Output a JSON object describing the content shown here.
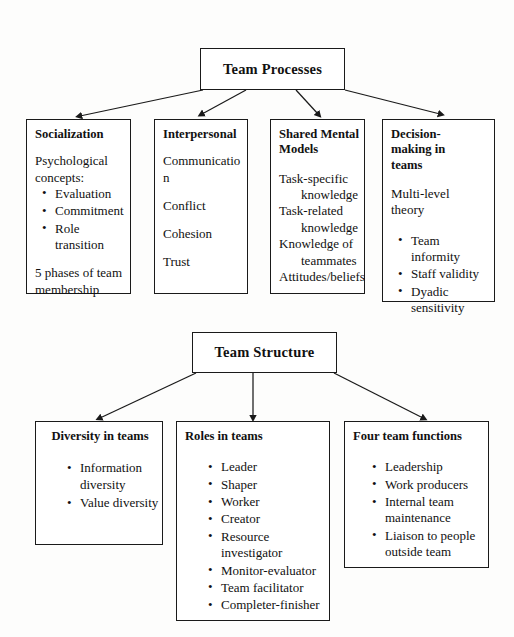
{
  "diagram": {
    "type": "hierarchy-flowchart",
    "sections": [
      {
        "id": "team-processes",
        "root": "Team Processes",
        "children": [
          {
            "id": "socialization",
            "title": "Socialization",
            "lead": "Psychological concepts:",
            "bullets": [
              "Evaluation",
              "Commitment",
              "Role transition"
            ],
            "footer": "5 phases of team membership"
          },
          {
            "id": "interpersonal",
            "title": "Interpersonal",
            "lines": [
              "Communication",
              "Conflict",
              "Cohesion",
              "Trust"
            ]
          },
          {
            "id": "shared-mental-models",
            "title": "Shared Mental Models",
            "items": [
              "Task-specific knowledge",
              "Task-related knowledge",
              "Knowledge of teammates",
              "Attitudes/beliefs"
            ]
          },
          {
            "id": "decision-making-in-teams",
            "title": "Decision-making in teams",
            "lead": "Multi-level theory",
            "bullets": [
              "Team informity",
              "Staff validity",
              "Dyadic sensitivity"
            ]
          }
        ]
      },
      {
        "id": "team-structure",
        "root": "Team Structure",
        "children": [
          {
            "id": "diversity-in-teams",
            "title": "Diversity in teams",
            "bullets": [
              "Information diversity",
              "Value diversity"
            ]
          },
          {
            "id": "roles-in-teams",
            "title": "Roles in teams",
            "bullets": [
              "Leader",
              "Shaper",
              "Worker",
              "Creator",
              "Resource investigator",
              "Monitor-evaluator",
              "Team facilitator",
              "Completer-finisher"
            ]
          },
          {
            "id": "four-team-functions",
            "title": "Four team functions",
            "bullets": [
              "Leadership",
              "Work producers",
              "Internal team maintenance",
              "Liaison to people outside team"
            ]
          }
        ]
      }
    ]
  },
  "colors": {
    "border": "#1a1a1a",
    "text": "#111111",
    "background": "#fdfdfc"
  }
}
